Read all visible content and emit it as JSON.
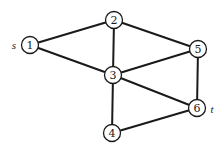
{
  "graph": {
    "nodes": [
      {
        "id": "1",
        "label": "1",
        "x": 30,
        "y": 45
      },
      {
        "id": "2",
        "label": "2",
        "x": 114,
        "y": 20
      },
      {
        "id": "3",
        "label": "3",
        "x": 113,
        "y": 75
      },
      {
        "id": "4",
        "label": "4",
        "x": 112,
        "y": 133
      },
      {
        "id": "5",
        "label": "5",
        "x": 198,
        "y": 49
      },
      {
        "id": "6",
        "label": "6",
        "x": 197,
        "y": 108
      }
    ],
    "edges": [
      {
        "from": "1",
        "to": "2"
      },
      {
        "from": "1",
        "to": "3"
      },
      {
        "from": "2",
        "to": "3"
      },
      {
        "from": "2",
        "to": "5"
      },
      {
        "from": "3",
        "to": "5"
      },
      {
        "from": "3",
        "to": "6"
      },
      {
        "from": "3",
        "to": "4"
      },
      {
        "from": "5",
        "to": "6"
      },
      {
        "from": "4",
        "to": "6"
      }
    ],
    "source_label": "s",
    "sink_label": "t",
    "node_radius": 8.5
  }
}
